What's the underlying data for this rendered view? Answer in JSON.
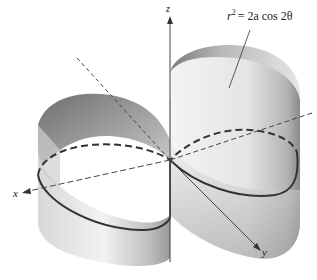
{
  "figure": {
    "equation": {
      "lhs_base": "r",
      "lhs_exp": "2",
      "rhs": "= 2a cos 2θ"
    },
    "axes": {
      "x_label": "x",
      "y_label": "y",
      "z_label": "z"
    },
    "surface": "cylinder over lemniscate",
    "colors": {
      "surface_light": "#e8e8e8",
      "surface_dark": "#8a8a8a",
      "curve": "#333333",
      "axis": "#444444"
    }
  }
}
